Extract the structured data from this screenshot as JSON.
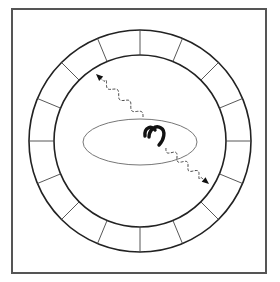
{
  "diagram": {
    "canvas": {
      "width": 280,
      "height": 282,
      "background": "#ffffff"
    },
    "frame": {
      "x": 12,
      "y": 9,
      "width": 254,
      "height": 264,
      "stroke": "#555555",
      "stroke_width": 2
    },
    "ring": {
      "cx": 140,
      "cy": 141,
      "outer_radius": 111,
      "inner_radius": 86,
      "segments": 16,
      "stroke": "#222222"
    },
    "ellipse": {
      "cx": 140,
      "cy": 142,
      "rx": 57,
      "ry": 23,
      "stroke": "#777777"
    },
    "object": {
      "name": "horseshoe-magnet",
      "cx": 154,
      "cy": 134,
      "color": "#111111"
    },
    "arrows": [
      {
        "name": "wavy-arrow-upper-left",
        "from": [
          143,
          117
        ],
        "to": [
          96,
          74
        ]
      },
      {
        "name": "wavy-arrow-lower-right",
        "from": [
          166,
          148
        ],
        "to": [
          209,
          184
        ]
      }
    ]
  }
}
